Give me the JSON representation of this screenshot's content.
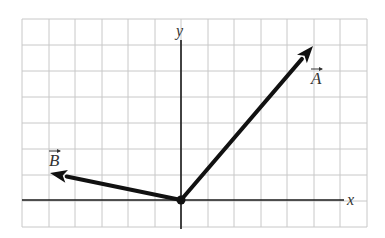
{
  "diagram": {
    "type": "vector-diagram",
    "grid": {
      "x_lines": [
        22,
        49,
        75,
        102,
        128,
        155,
        181,
        208,
        234,
        261,
        287,
        314,
        340,
        367
      ],
      "y_lines": [
        19,
        45,
        71,
        97,
        123,
        149,
        175,
        201,
        227
      ],
      "color": "#c8c8c8"
    },
    "axes": {
      "x_label": "x",
      "y_label": "y",
      "origin_px": [
        181,
        200
      ],
      "color": "#1a1a1a"
    },
    "vectors": [
      {
        "name": "A",
        "label": "A",
        "components_cells": [
          5,
          6
        ],
        "tip_px": [
          313,
          46
        ],
        "label_pos": [
          311,
          84
        ]
      },
      {
        "name": "B",
        "label": "B",
        "components_cells": [
          -5,
          1
        ],
        "tip_px": [
          50,
          173
        ],
        "label_pos": [
          49,
          166
        ]
      }
    ],
    "vector_color": "#111111"
  }
}
